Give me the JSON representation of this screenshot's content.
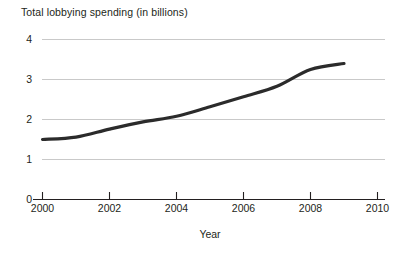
{
  "chart_data": {
    "type": "line",
    "title": "Total lobbying spending (in billions)",
    "xlabel": "Year",
    "ylabel": "",
    "xlim": [
      2000,
      2010
    ],
    "ylim": [
      0,
      4
    ],
    "grid": true,
    "legend": "none",
    "x_ticks": [
      "2000",
      "2002",
      "2004",
      "2006",
      "2008",
      "2010"
    ],
    "x_tick_values": [
      2000,
      2002,
      2004,
      2006,
      2008,
      2010
    ],
    "y_ticks": [
      "0",
      "1",
      "2",
      "3",
      "4"
    ],
    "y_tick_values": [
      0,
      1,
      2,
      3,
      4
    ],
    "line_color": "#2b2b2b",
    "grid_color": "#c9c9c9",
    "axis_color": "#231f20",
    "series": [
      {
        "name": "Total lobbying spending",
        "x": [
          2000,
          2001,
          2002,
          2003,
          2004,
          2005,
          2006,
          2007,
          2008,
          2009
        ],
        "values": [
          1.5,
          1.56,
          1.76,
          1.94,
          2.08,
          2.32,
          2.57,
          2.83,
          3.25,
          3.4
        ]
      }
    ]
  },
  "labels": {
    "title": "Total lobbying spending (in billions)",
    "x_axis_title": "Year",
    "ytick_0": "0",
    "ytick_1": "1",
    "ytick_2": "2",
    "ytick_3": "3",
    "ytick_4": "4",
    "xtick_2000": "2000",
    "xtick_2002": "2002",
    "xtick_2004": "2004",
    "xtick_2006": "2006",
    "xtick_2008": "2008",
    "xtick_2010": "2010"
  }
}
